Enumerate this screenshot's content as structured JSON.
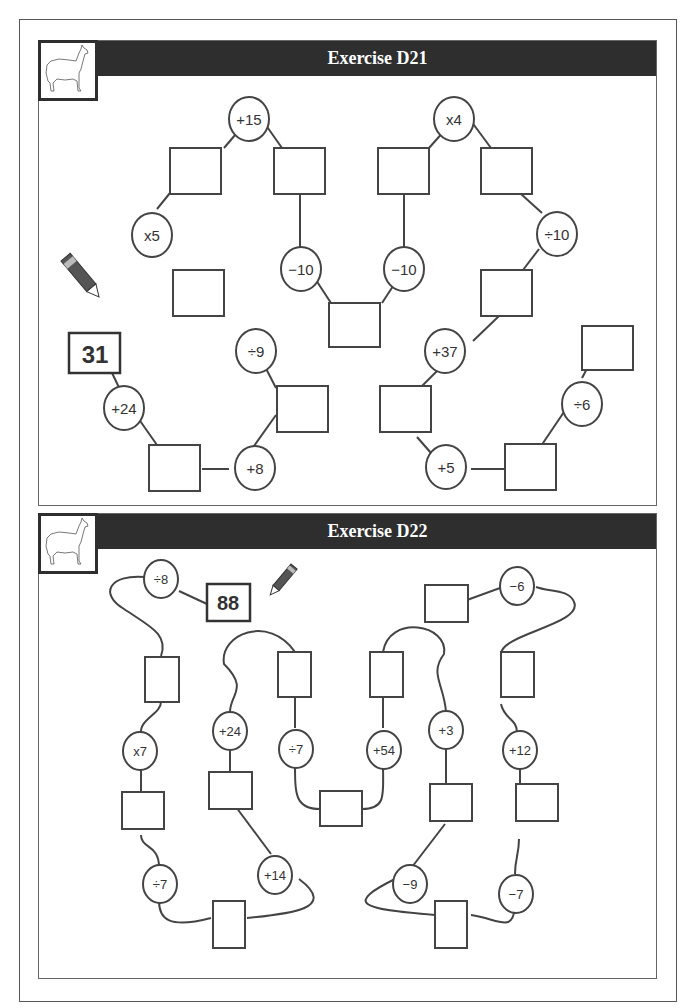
{
  "exercises": [
    {
      "title": "Exercise D21",
      "start_value": "31",
      "operations": [
        "+24",
        "+8",
        "÷9",
        "x5",
        "+15",
        "−10",
        "−10",
        "x4",
        "÷10",
        "+37",
        "+5",
        "÷6"
      ]
    },
    {
      "title": "Exercise D22",
      "start_value": "88",
      "operations": [
        "÷8",
        "x7",
        "÷7",
        "+14",
        "+24",
        "÷7",
        "+54",
        "+3",
        "−9",
        "−7",
        "+12",
        "−6"
      ]
    }
  ],
  "icons": {
    "llama": "llama-illustration",
    "pencil": "pencil-icon"
  },
  "colors": {
    "title_bar": "#2e2e2e",
    "line": "#444444",
    "text": "#333333"
  }
}
